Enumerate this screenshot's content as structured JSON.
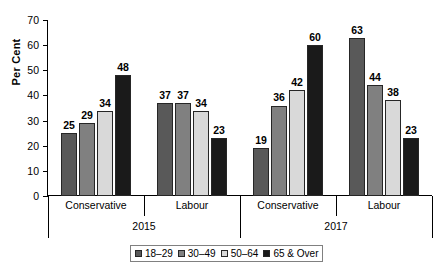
{
  "chart_data": {
    "type": "bar",
    "title": "",
    "subtitle": "",
    "xlabel": "",
    "ylabel": "Per Cent",
    "ylim": [
      0,
      70
    ],
    "ytick_step": 10,
    "yticks": [
      70,
      60,
      50,
      40,
      30,
      20,
      10,
      0
    ],
    "grid": false,
    "legend_position": "bottom-center",
    "categories": [
      "Conservative",
      "Labour",
      "Conservative",
      "Labour"
    ],
    "group_tiers": [
      {
        "label": "2015",
        "categories": [
          "Conservative",
          "Labour"
        ]
      },
      {
        "label": "2017",
        "categories": [
          "Conservative",
          "Labour"
        ]
      }
    ],
    "series": [
      {
        "name": "18–29",
        "color": "#595959",
        "values": [
          25,
          37,
          19,
          63
        ]
      },
      {
        "name": "30–49",
        "color": "#808080",
        "values": [
          29,
          37,
          36,
          44
        ]
      },
      {
        "name": "50–64",
        "color": "#d9d9d9",
        "values": [
          34,
          34,
          42,
          38
        ]
      },
      {
        "name": "65 & Over",
        "color": "#1a1a1a",
        "values": [
          48,
          23,
          60,
          23
        ]
      }
    ],
    "data_labels": [
      [
        25,
        29,
        34,
        48
      ],
      [
        37,
        37,
        34,
        23
      ],
      [
        19,
        36,
        42,
        60
      ],
      [
        63,
        44,
        38,
        23
      ]
    ]
  },
  "axis": {
    "y_title": "Per Cent"
  },
  "legend": {
    "entries": [
      {
        "label": "18–29"
      },
      {
        "label": "30–49"
      },
      {
        "label": "50–64"
      },
      {
        "label": "65 & Over"
      }
    ]
  }
}
